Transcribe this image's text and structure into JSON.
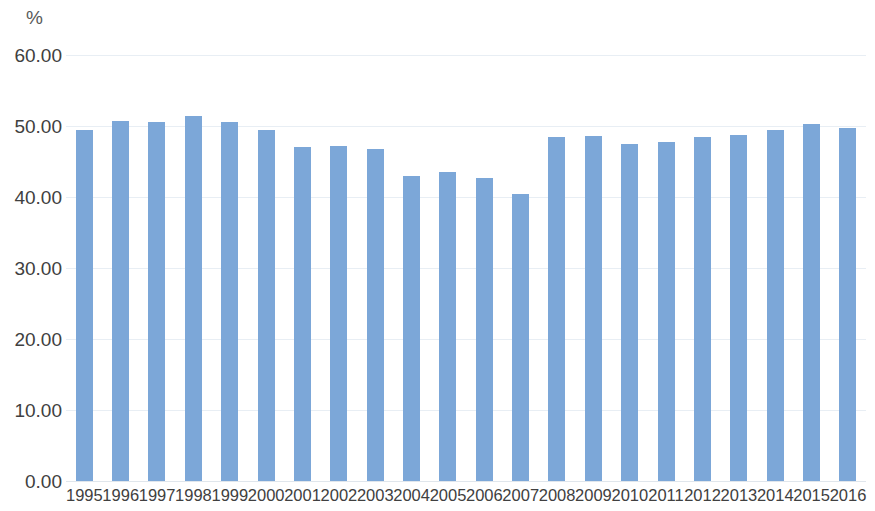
{
  "chart_data": {
    "type": "bar",
    "title": "",
    "subtitle": "",
    "xlabel": "",
    "ylabel": "%",
    "unit_label": "%",
    "ylim": [
      0,
      60
    ],
    "ytick_step": 10,
    "ytick_labels": [
      "60.00",
      "50.00",
      "40.00",
      "30.00",
      "20.00",
      "10.00",
      "0.00"
    ],
    "ytick_values": [
      60,
      50,
      40,
      30,
      20,
      10,
      0
    ],
    "grid": true,
    "legend": null,
    "legend_position": "none",
    "bar_color": "#7ca7d8",
    "gridline_color": "#e8eef4",
    "text_color": "#404040",
    "categories": [
      "1995",
      "1996",
      "1997",
      "1998",
      "1999",
      "2000",
      "2001",
      "2002",
      "2003",
      "2004",
      "2005",
      "2006",
      "2007",
      "2008",
      "2009",
      "2010",
      "2011",
      "2012",
      "2013",
      "2014",
      "2015",
      "2016"
    ],
    "values": [
      49.4,
      50.7,
      50.6,
      51.4,
      50.5,
      49.4,
      47.0,
      47.2,
      46.8,
      42.9,
      43.5,
      42.7,
      40.4,
      48.4,
      48.6,
      47.5,
      47.8,
      48.5,
      48.8,
      49.4,
      50.3,
      49.7
    ],
    "series": [
      {
        "name": "",
        "values": [
          49.4,
          50.7,
          50.6,
          51.4,
          50.5,
          49.4,
          47.0,
          47.2,
          46.8,
          42.9,
          43.5,
          42.7,
          40.4,
          48.4,
          48.6,
          47.5,
          47.8,
          48.5,
          48.8,
          49.4,
          50.3,
          49.7
        ]
      }
    ]
  }
}
